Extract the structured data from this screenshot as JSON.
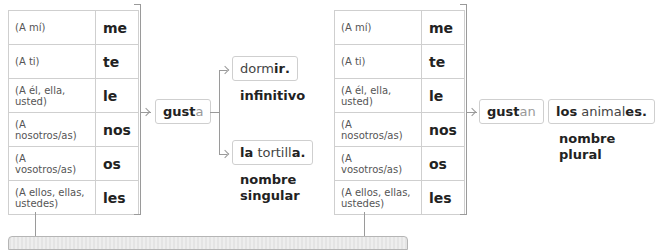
{
  "left_table": {
    "rows": [
      {
        "label": "(A mí)",
        "value": "me"
      },
      {
        "label": "(A ti)",
        "value": "te"
      },
      {
        "label": "(A él, ella, usted)",
        "value": "le"
      },
      {
        "label": "(A nosotros/as)",
        "value": "nos"
      },
      {
        "label": "(A vosotros/as)",
        "value": "os"
      },
      {
        "label": "(A ellos, ellas, ustedes)",
        "value": "les"
      }
    ]
  },
  "right_table": {
    "rows": [
      {
        "label": "(A mí)",
        "value": "me"
      },
      {
        "label": "(A ti)",
        "value": "te"
      },
      {
        "label": "(A él, ella, usted)",
        "value": "le"
      },
      {
        "label": "(A nosotros/as)",
        "value": "nos"
      },
      {
        "label": "(A vosotros/as)",
        "value": "os"
      },
      {
        "label": "(A ellos, ellas, ustedes)",
        "value": "les"
      }
    ]
  },
  "verb_singular": {
    "stem": "gust",
    "ending": "a"
  },
  "verb_plural": {
    "stem": "gust",
    "ending": "an"
  },
  "example_infinitive": {
    "stem": "dorm",
    "ending": "ir",
    "punct": "."
  },
  "caption_infinitive": "infinitivo",
  "example_singular": {
    "article": "la",
    "stem": "tortill",
    "ending": "a",
    "punct": "."
  },
  "caption_singular_line1": "nombre",
  "caption_singular_line2": "singular",
  "example_plural": {
    "article": "los",
    "stem": "animal",
    "ending": "es",
    "punct": "."
  },
  "caption_plural_line1": "nombre",
  "caption_plural_line2": "plural",
  "colors": {
    "border": "#cfcfcf",
    "connector": "#9a9a9a",
    "muted_ending": "#999999",
    "text": "#222222"
  }
}
